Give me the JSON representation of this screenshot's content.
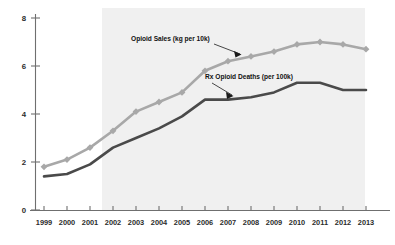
{
  "chart_data": {
    "type": "line",
    "title": "",
    "subtitle": "",
    "xlabel": "",
    "ylabel": "",
    "xlim": [
      1999,
      2013
    ],
    "ylim": [
      0,
      8
    ],
    "yticks": [
      0,
      2,
      4,
      6,
      8
    ],
    "grid": false,
    "legend_position": "inline-annotation",
    "categories": [
      "1999",
      "2000",
      "2001",
      "2002",
      "2003",
      "2004",
      "2005",
      "2006",
      "2007",
      "2008",
      "2009",
      "2010",
      "2011",
      "2012",
      "2013"
    ],
    "series": [
      {
        "name": "Opioid Sales (kg per 10k)",
        "color": "#a8a8a8",
        "marker": "diamond",
        "values": [
          1.8,
          2.1,
          2.6,
          3.3,
          4.1,
          4.5,
          4.9,
          5.8,
          6.2,
          6.4,
          6.6,
          6.9,
          7.0,
          6.9,
          6.7
        ]
      },
      {
        "name": "Rx Opioid Deaths (per 100k)",
        "color": "#4a4a4a",
        "marker": "none",
        "values": [
          1.4,
          1.5,
          1.9,
          2.6,
          3.0,
          3.4,
          3.9,
          4.6,
          4.6,
          4.7,
          4.9,
          5.3,
          5.3,
          5.0,
          5.0
        ]
      }
    ],
    "annotations": [
      {
        "name": "opioid-sales-annotation",
        "text": "Opioid Sales (kg per 10k)",
        "points_to_year": 2007
      },
      {
        "name": "rx-opioid-deaths-annotation",
        "text": "Rx Opioid Deaths (per 100k)",
        "points_to_year": 2007
      }
    ],
    "shaded_region": {
      "name": "highlight-band",
      "from_year": 2002,
      "to_year": 2013,
      "color": "#f0f0f0"
    },
    "tick_labels_x": [
      "1999",
      "2000",
      "2001",
      "2002",
      "2003",
      "2004",
      "2005",
      "2006",
      "2007",
      "2008",
      "2009",
      "2010",
      "2011",
      "2012",
      "2013"
    ],
    "tick_labels_y": [
      "0",
      "2",
      "4",
      "6",
      "8"
    ]
  }
}
